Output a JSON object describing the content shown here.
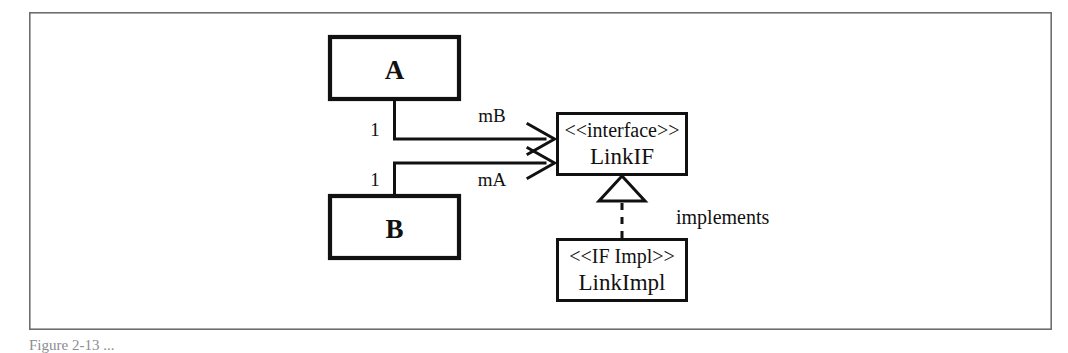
{
  "figure": {
    "kind": "uml-class-diagram",
    "caption": "Figure  2-13  ...",
    "frame": {
      "x": 29,
      "y": 12,
      "width": 1023,
      "height": 318,
      "stroke_color": "#6e6e72"
    },
    "stroke_color": "#111111",
    "background_color": "#ffffff"
  },
  "classes": [
    {
      "id": "class-a",
      "name": "A",
      "stereotype": "",
      "x": 328,
      "y": 35,
      "width": 133,
      "height": 66
    },
    {
      "id": "class-b",
      "name": "B",
      "stereotype": "",
      "x": 328,
      "y": 194,
      "width": 133,
      "height": 66
    },
    {
      "id": "interface-linkif",
      "name": "LinkIF",
      "stereotype": "<<interface>>",
      "x": 556,
      "y": 112,
      "width": 132,
      "height": 64
    },
    {
      "id": "class-linkimpl",
      "name": "LinkImpl",
      "stereotype": "<<IF Impl>>",
      "x": 556,
      "y": 238,
      "width": 132,
      "height": 64
    }
  ],
  "associations": [
    {
      "id": "assoc-a-linkif",
      "from": "class-a",
      "to": "interface-linkif",
      "role_label": "mB",
      "multiplicity": "1",
      "arrow": "open"
    },
    {
      "id": "assoc-b-linkif",
      "from": "class-b",
      "to": "interface-linkif",
      "role_label": "mA",
      "multiplicity": "1",
      "arrow": "open"
    }
  ],
  "realization": {
    "id": "realize-linkimpl-linkif",
    "from": "class-linkimpl",
    "to": "interface-linkif",
    "label": "implements",
    "line_style": "dashed",
    "arrow": "hollow-triangle",
    "label_x": 676,
    "label_y": 224
  },
  "labels": {
    "mB": {
      "x": 492,
      "y": 122
    },
    "mA": {
      "x": 492,
      "y": 186
    },
    "mult_a": {
      "x": 371,
      "y": 136
    },
    "mult_b": {
      "x": 371,
      "y": 186
    }
  }
}
